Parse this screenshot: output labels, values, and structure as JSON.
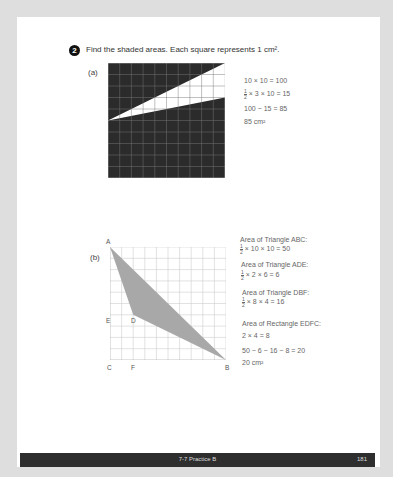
{
  "question": {
    "number": "2",
    "text": "Find the shaded areas. Each square represents 1 cm²."
  },
  "part_a": {
    "label": "(a)",
    "grid": {
      "cols": 10,
      "rows": 10,
      "shade_color": "#2b2b2b",
      "unshaded_triangle": [
        [
          0,
          5
        ],
        [
          10,
          0
        ],
        [
          10,
          3
        ]
      ]
    },
    "work": {
      "line1": "10 × 10 = 100",
      "line2_frac_num": "1",
      "line2_frac_den": "2",
      "line2": "× 3 × 10 = 15",
      "line3": "100 − 15 = 85",
      "line4": "85 cm²"
    }
  },
  "part_b": {
    "label": "(b)",
    "grid": {
      "cols": 10,
      "rows": 10,
      "shade_color": "#a8a8a8",
      "shaded_triangle": [
        [
          0,
          0
        ],
        [
          10,
          10
        ],
        [
          2,
          6
        ]
      ]
    },
    "points": {
      "A": "A",
      "B": "B",
      "C": "C",
      "D": "D",
      "E": "E",
      "F": "F"
    },
    "work": {
      "abc_title": "Area of Triangle ABC:",
      "abc_calc": "× 10 × 10 = 50",
      "ade_title": "Area of Triangle ADE:",
      "ade_calc": "× 2 × 6 = 6",
      "dbf_title": "Area of Triangle DBF:",
      "dbf_calc": "× 8 × 4 = 16",
      "rect_title": "Area of Rectangle EDFC:",
      "rect_calc": "2 × 4 = 8",
      "final_calc": "50 − 6 − 16 − 8 = 20",
      "answer": "20 cm²",
      "frac_num": "1",
      "frac_den": "2"
    }
  },
  "footer": {
    "section": "7-7 Practice B",
    "page_number": "181"
  }
}
